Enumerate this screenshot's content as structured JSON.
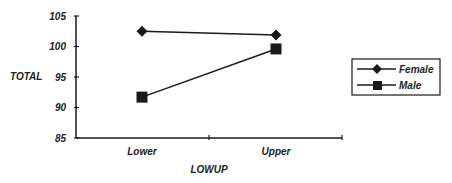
{
  "chart_data": {
    "type": "line",
    "title": "",
    "xlabel": "LOWUP",
    "ylabel": "TOTAL",
    "categories": [
      "Lower",
      "Upper"
    ],
    "series": [
      {
        "name": "Female",
        "marker": "diamond",
        "values": [
          102.5,
          101.9
        ]
      },
      {
        "name": "Male",
        "marker": "square",
        "values": [
          91.7,
          99.6
        ]
      }
    ],
    "ylim": [
      85,
      105
    ],
    "yticks": [
      "85",
      "90",
      "95",
      "100",
      "105"
    ],
    "grid": false,
    "legend_position": "right"
  },
  "colors": {
    "line": "#1a1a1a",
    "marker": "#1a1a1a",
    "background": "#ffffff"
  }
}
